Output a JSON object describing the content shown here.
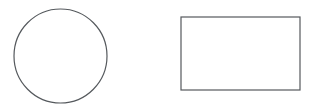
{
  "canvas": {
    "width": 316,
    "height": 108,
    "background_color": "#ffffff",
    "description": "Line drawing of two unfilled geometric shapes on a plain white background: a circle on the left and a rectangle on the right."
  },
  "style": {
    "stroke_color": "#55595d",
    "stroke_width": 1.2,
    "fill": "none"
  },
  "shapes": [
    {
      "name": "circle",
      "type": "ellipse",
      "label": "Circle",
      "center_x": 60.5,
      "center_y": 56,
      "radius_x": 46.5,
      "radius_y": 47,
      "bbox": {
        "x": 14,
        "y": 9,
        "width": 93,
        "height": 94
      },
      "stroke_color": "#55595d",
      "stroke_width": 1.2,
      "fill": "none"
    },
    {
      "name": "rectangle",
      "type": "rect",
      "label": "Rectangle",
      "x": 181,
      "y": 17,
      "width": 119,
      "height": 73,
      "bbox": {
        "x": 181,
        "y": 17,
        "width": 119,
        "height": 73
      },
      "stroke_color": "#55595d",
      "stroke_width": 1.2,
      "fill": "none"
    }
  ]
}
